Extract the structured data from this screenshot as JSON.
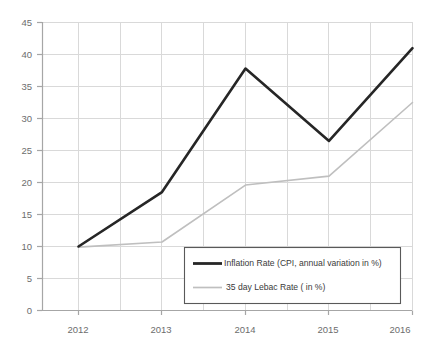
{
  "chart_data": {
    "type": "line",
    "title": "",
    "subtitle": "",
    "xlabel": "",
    "ylabel": "",
    "categories": [
      "2012",
      "2013",
      "2014",
      "2015",
      "2016"
    ],
    "x": [
      2012,
      2013,
      2014,
      2015,
      2016
    ],
    "ylim": [
      0,
      45
    ],
    "y_ticks": [
      0,
      5,
      10,
      15,
      20,
      25,
      30,
      35,
      40,
      45
    ],
    "y_tick_labels": [
      "0",
      "5",
      "10",
      "15",
      "20",
      "25",
      "30",
      "35",
      "40",
      "45"
    ],
    "grid": true,
    "grid_axis": "both",
    "legend_position": "lower right (inside plot area)",
    "series": [
      {
        "name": "Inflation Rate (CPI, annual variation in %)",
        "color": "#262626",
        "width": 2.6,
        "values": [
          10.0,
          18.5,
          37.8,
          26.5,
          41.0
        ]
      },
      {
        "name": "35 day Lebac Rate ( in %)",
        "color": "#bfbfbf",
        "width": 1.6,
        "values": [
          9.9,
          10.7,
          19.6,
          21.0,
          32.5
        ]
      }
    ]
  },
  "legend": {
    "entries": [
      {
        "label": "Inflation Rate (CPI, annual variation in %)",
        "color": "#262626",
        "width": 2.6
      },
      {
        "label": "35 day Lebac Rate ( in %)",
        "color": "#bfbfbf",
        "width": 1.6
      }
    ]
  },
  "axes": {
    "y_tick_labels": [
      "45",
      "40",
      "35",
      "30",
      "25",
      "20",
      "15",
      "10",
      "5",
      "0"
    ],
    "x_tick_labels": [
      "2012",
      "2013",
      "2014",
      "2015",
      "2016"
    ]
  },
  "colors": {
    "series_primary": "#262626",
    "series_secondary": "#bfbfbf",
    "grid": "#d9d9d9",
    "axis": "#a6a6a6",
    "tick_label": "#6d6d6d",
    "legend_border": "#595959",
    "background": "#ffffff"
  }
}
